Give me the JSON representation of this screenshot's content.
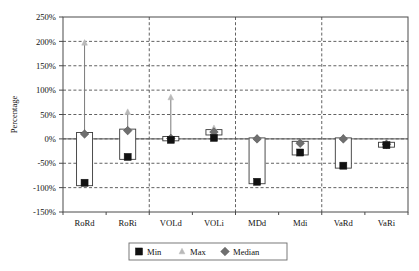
{
  "chart_data": {
    "type": "bar",
    "title": "",
    "subtitle": "",
    "xlabel": "",
    "ylabel": "Percentage",
    "ylim": [
      -150,
      250
    ],
    "ytick_step": 50,
    "ytick_labels": [
      "250%",
      "200%",
      "150%",
      "100%",
      "50%",
      "0%",
      "-50%",
      "-100%",
      "-150%"
    ],
    "ytick_values": [
      250,
      200,
      150,
      100,
      50,
      0,
      -50,
      -100,
      -150
    ],
    "grid": "horizontal-dashed-and-vertical-group-separators",
    "legend_position": "bottom-center",
    "categories": [
      "RoRd",
      "RoRi",
      "VOLd",
      "VOLi",
      "MDd",
      "Mdi",
      "VaRd",
      "VaRi"
    ],
    "group_separators_after": [
      "RoRi",
      "VOLi",
      "Mdi"
    ],
    "series": [
      {
        "name": "Min",
        "marker": "square",
        "color": "#111111",
        "values": [
          -90,
          -37,
          -2,
          2,
          -88,
          -28,
          -55,
          -13
        ]
      },
      {
        "name": "Max",
        "marker": "triangle",
        "color": "#b9b9b9",
        "values": [
          197,
          55,
          85,
          22,
          2,
          -7,
          3,
          -9
        ]
      },
      {
        "name": "Median",
        "marker": "diamond",
        "color": "#6f6f6f",
        "values": [
          10,
          17,
          1,
          14,
          0,
          -9,
          0,
          -11
        ]
      }
    ],
    "boxes": [
      {
        "category": "RoRd",
        "top": 13,
        "bottom": -96
      },
      {
        "category": "RoRi",
        "top": 20,
        "bottom": -42
      },
      {
        "category": "VOLd",
        "top": 5,
        "bottom": -4
      },
      {
        "category": "VOLi",
        "top": 19,
        "bottom": 8
      },
      {
        "category": "MDd",
        "top": 2,
        "bottom": -92
      },
      {
        "category": "Mdi",
        "top": -5,
        "bottom": -33
      },
      {
        "category": "VaRd",
        "top": 2,
        "bottom": -60
      },
      {
        "category": "VaRi",
        "top": -7,
        "bottom": -17
      }
    ]
  },
  "legend": {
    "items": [
      {
        "label": "Min",
        "marker": "square",
        "color": "#111111"
      },
      {
        "label": "Max",
        "marker": "triangle",
        "color": "#b9b9b9"
      },
      {
        "label": "Median",
        "marker": "diamond",
        "color": "#6f6f6f"
      }
    ]
  },
  "axis": {
    "y_title": "Percentage"
  }
}
